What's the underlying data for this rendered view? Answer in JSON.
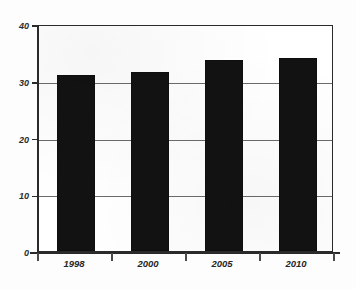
{
  "chart_data": {
    "type": "bar",
    "title": "",
    "subtitle": "",
    "xlabel": "",
    "ylabel": "",
    "categories": [
      "1998",
      "2000",
      "2005",
      "2010"
    ],
    "values": [
      31,
      31.5,
      33.7,
      34
    ],
    "ylim": [
      0,
      40
    ],
    "yticks": [
      0,
      10,
      20,
      30,
      40
    ],
    "ytick_labels": [
      "0",
      "10",
      "20",
      "30",
      "40"
    ],
    "grid": true,
    "grid_axis": "y",
    "legend": false,
    "legend_position": "none",
    "series": [
      {
        "name": "",
        "values": [
          31,
          31.5,
          33.7,
          34
        ]
      }
    ],
    "annotations": [],
    "bar_color": "#121212",
    "axis_color": "#2a2a2a",
    "grid_color": "#6b6b6b",
    "background_color": "#ffffff"
  }
}
